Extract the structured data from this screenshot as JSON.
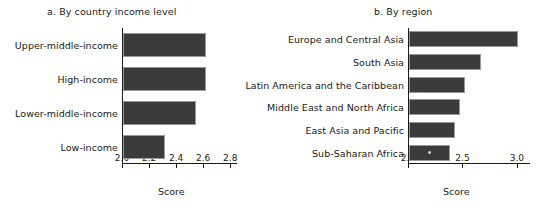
{
  "chart_data": [
    {
      "type": "bar",
      "orientation": "horizontal",
      "title": "a. By country income level",
      "xlabel": "Score",
      "ylabel": "",
      "categories": [
        "Upper-middle-income",
        "High-income",
        "Lower-middle-income",
        "Low-income"
      ],
      "values": [
        2.61,
        2.61,
        2.54,
        2.31
      ],
      "xlim": [
        2.0,
        2.85
      ],
      "xticks": [
        2.0,
        2.2,
        2.4,
        2.6,
        2.8
      ],
      "xticklabels": [
        "2.0",
        "2.2",
        "2.4",
        "2.6",
        "2.8"
      ],
      "grid": false,
      "legend": "none",
      "bar_color": "#3b3b3b"
    },
    {
      "type": "bar",
      "orientation": "horizontal",
      "title": "b. By region",
      "xlabel": "Score",
      "ylabel": "",
      "categories": [
        "Europe and Central Asia",
        "South Asia",
        "Latin America and the Caribbean",
        "Middle East and North Africa",
        "East Asia and Pacific",
        "Sub-Saharan Africa"
      ],
      "values": [
        3.0,
        2.66,
        2.51,
        2.47,
        2.42,
        2.38
      ],
      "xlim": [
        2.0,
        3.12
      ],
      "xticks": [
        2.0,
        2.5,
        3.0
      ],
      "xticklabels": [
        "2.0",
        "2.5",
        "3.0"
      ],
      "grid": false,
      "legend": "none",
      "bar_color": "#3b3b3b"
    }
  ]
}
